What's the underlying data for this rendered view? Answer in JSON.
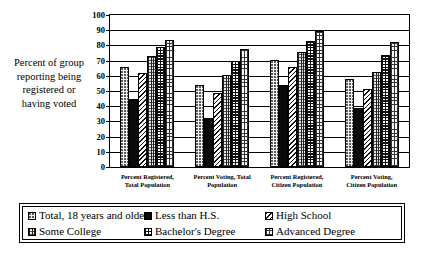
{
  "chart_data": {
    "type": "bar",
    "title": "",
    "xlabel": "",
    "ylabel": "Percent of group reporting being registered or having voted",
    "ylim": [
      0,
      100
    ],
    "ytick_step": 10,
    "yticks": [
      "100",
      "90",
      "80",
      "70",
      "60",
      "50",
      "40",
      "30",
      "20",
      "10",
      "0"
    ],
    "grid": true,
    "legend_position": "bottom",
    "categories": [
      "Percent Registered, Total Population",
      "Percent Voting, Total Population",
      "Percent Registered, Citizen Population",
      "Percent Voting, Citizen Population"
    ],
    "category_lines": [
      [
        "Percent Registered,",
        "Total Population"
      ],
      [
        "Percent Voting, Total",
        "Population"
      ],
      [
        "Percent Registered,",
        "Citizen Population"
      ],
      [
        "Percent Voting,",
        "Citizen Population"
      ]
    ],
    "series": [
      {
        "name": "Total, 18 years and older",
        "pattern": "dots",
        "values": [
          66.0,
          54.0,
          70.5,
          58.0
        ]
      },
      {
        "name": "Less than H.S.",
        "pattern": "solid",
        "values": [
          45.0,
          32.5,
          54.0,
          38.5
        ]
      },
      {
        "name": "High School",
        "pattern": "diag",
        "values": [
          62.0,
          49.0,
          65.5,
          51.0
        ]
      },
      {
        "name": "Some College",
        "pattern": "vert",
        "values": [
          73.0,
          60.5,
          75.5,
          62.5
        ]
      },
      {
        "name": "Bachelor's Degree",
        "pattern": "check",
        "values": [
          79.0,
          70.0,
          83.0,
          73.5
        ]
      },
      {
        "name": "Advanced Degree",
        "pattern": "grid",
        "values": [
          83.5,
          77.5,
          89.5,
          82.5
        ]
      }
    ]
  },
  "axis_title": {
    "lines": [
      "Percent of group",
      "reporting being",
      "registered or",
      "having voted"
    ]
  },
  "legend": {
    "items": [
      {
        "label": "Total, 18 years and older",
        "pattern": "dots"
      },
      {
        "label": "Less than H.S.",
        "pattern": "solid"
      },
      {
        "label": "High School",
        "pattern": "diag"
      },
      {
        "label": "Some College",
        "pattern": "vert"
      },
      {
        "label": "Bachelor's Degree",
        "pattern": "check"
      },
      {
        "label": "Advanced Degree",
        "pattern": "grid"
      }
    ]
  },
  "colors": {
    "axis": "#000000",
    "background": "#ffffff",
    "bar_outline": "#000000"
  }
}
